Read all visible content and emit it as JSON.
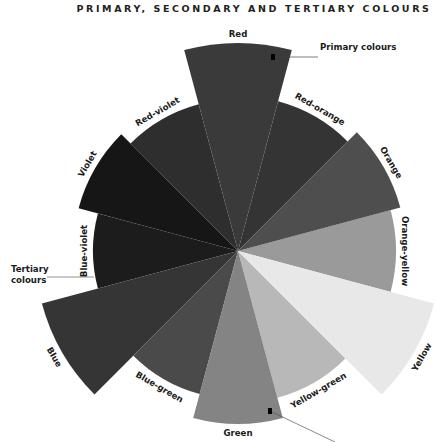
{
  "title": "PRIMARY, SECONDARY AND TERTIARY COLOURS",
  "wheel": {
    "center": [
      238,
      251
    ],
    "segment_angle_deg": 30,
    "segments": [
      {
        "name": "Red",
        "type": "primary",
        "angle": 0,
        "radius": 208,
        "fill": "#3a3a3a"
      },
      {
        "name": "Red-orange",
        "type": "tertiary",
        "angle": 30,
        "radius": 155,
        "fill": "#343434"
      },
      {
        "name": "Orange",
        "type": "secondary",
        "angle": 60,
        "radius": 168,
        "fill": "#4e4e4e"
      },
      {
        "name": "Orange-yellow",
        "type": "tertiary",
        "angle": 90,
        "radius": 158,
        "fill": "#9a9a9a"
      },
      {
        "name": "Yellow",
        "type": "primary",
        "angle": 120,
        "radius": 203,
        "fill": "#e8e8e8"
      },
      {
        "name": "Yellow-green",
        "type": "tertiary",
        "angle": 150,
        "radius": 152,
        "fill": "#b8b8b8"
      },
      {
        "name": "Green",
        "type": "secondary",
        "angle": 180,
        "radius": 173,
        "fill": "#848484"
      },
      {
        "name": "Blue-green",
        "type": "tertiary",
        "angle": 210,
        "radius": 148,
        "fill": "#4a4a4a"
      },
      {
        "name": "Blue",
        "type": "primary",
        "angle": 240,
        "radius": 203,
        "fill": "#353535"
      },
      {
        "name": "Blue-violet",
        "type": "tertiary",
        "angle": 270,
        "radius": 145,
        "fill": "#1c1c1c"
      },
      {
        "name": "Violet",
        "type": "secondary",
        "angle": 300,
        "radius": 165,
        "fill": "#161616"
      },
      {
        "name": "Red-violet",
        "type": "tertiary",
        "angle": 330,
        "radius": 152,
        "fill": "#2e2e2e"
      }
    ]
  },
  "callouts": {
    "primary": {
      "label": "Primary colours"
    },
    "tertiary": {
      "label_line1": "Tertiary",
      "label_line2": "colours"
    },
    "secondary": {
      "label": ""
    }
  }
}
